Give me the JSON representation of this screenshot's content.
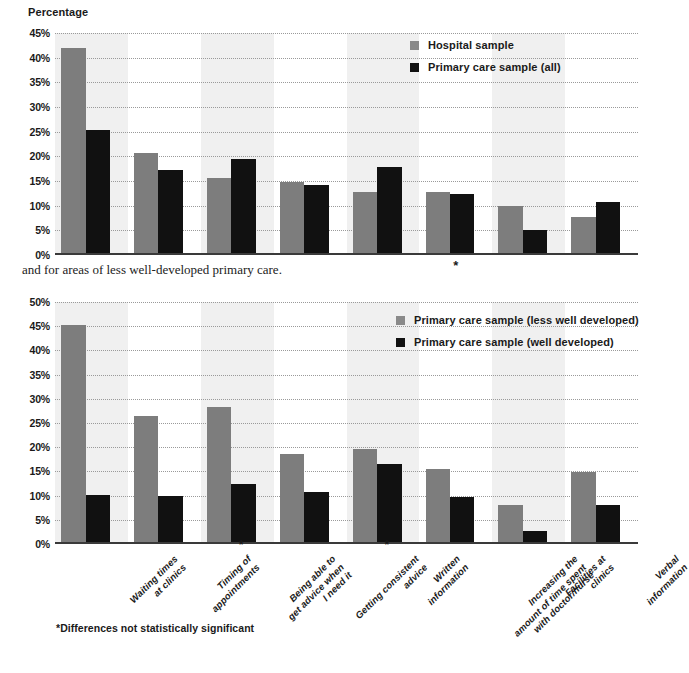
{
  "axis_title": "Percentage",
  "interstitial_text": "and for areas of less well-developed primary care.",
  "footnote": "*Differences not statistically significant",
  "asterisk": "*",
  "colors": {
    "series_a": "#7d7d7d",
    "series_b": "#111111",
    "band": "#ebebeb",
    "grid": "#9a9a9a"
  },
  "categories": [
    "Waiting times\nat clinics",
    "Timing of\nappointments",
    "Being able to\nget advice when\nI need it",
    "Getting consistent\nadvice",
    "Written\ninformation",
    "Increasing the\namount of time spent\nwith doctor/nurse",
    "Facilities at\nclinics",
    "Verbal\ninformation"
  ],
  "chart_data": [
    {
      "type": "bar",
      "title": "",
      "xlabel": "",
      "ylabel": "Percentage",
      "ylim": [
        0,
        45
      ],
      "ytick_labels": [
        "0%",
        "5%",
        "10%",
        "15%",
        "20%",
        "25%",
        "30%",
        "35%",
        "40%",
        "45%"
      ],
      "ytick_values": [
        0,
        5,
        10,
        15,
        20,
        25,
        30,
        35,
        40,
        45
      ],
      "grid": true,
      "legend_position": "top-right",
      "categories": [
        "Waiting times at clinics",
        "Timing of appointments",
        "Being able to get advice when I need it",
        "Getting consistent advice",
        "Written information",
        "Increasing the amount of time spent with doctor/nurse",
        "Facilities at clinics",
        "Verbal information"
      ],
      "series": [
        {
          "name": "Hospital sample",
          "color": "#7d7d7d",
          "values": [
            42.0,
            20.7,
            15.7,
            14.8,
            12.7,
            12.7,
            9.9,
            7.8
          ]
        },
        {
          "name": "Primary care sample (all)",
          "color": "#111111",
          "values": [
            25.3,
            17.2,
            19.5,
            14.2,
            17.8,
            12.3,
            5.0,
            10.8
          ]
        }
      ],
      "not_significant_categories": [
        "Increasing the amount of time spent with doctor/nurse"
      ]
    },
    {
      "type": "bar",
      "title": "",
      "xlabel": "",
      "ylabel": "",
      "ylim": [
        0,
        50
      ],
      "ytick_labels": [
        "0%",
        "5%",
        "10%",
        "15%",
        "20%",
        "25%",
        "30%",
        "35%",
        "40%",
        "45%",
        "50%"
      ],
      "ytick_values": [
        0,
        5,
        10,
        15,
        20,
        25,
        30,
        35,
        40,
        45,
        50
      ],
      "grid": true,
      "legend_position": "top-right",
      "categories": [
        "Waiting times at clinics",
        "Timing of appointments",
        "Being able to get advice when I need it",
        "Getting consistent advice",
        "Written information",
        "Increasing the amount of time spent with doctor/nurse",
        "Facilities at clinics",
        "Verbal information"
      ],
      "series": [
        {
          "name": "Primary care sample (less well developed)",
          "color": "#7d7d7d",
          "values": [
            45.3,
            26.4,
            28.4,
            18.5,
            19.6,
            15.4,
            8.0,
            14.8
          ]
        },
        {
          "name": "Primary care sample (well developed)",
          "color": "#111111",
          "values": [
            10.2,
            10.0,
            12.4,
            10.7,
            16.6,
            9.8,
            2.7,
            8.1
          ]
        }
      ],
      "not_significant_categories": [
        "Being able to get advice when I need it",
        "Written information"
      ]
    }
  ]
}
